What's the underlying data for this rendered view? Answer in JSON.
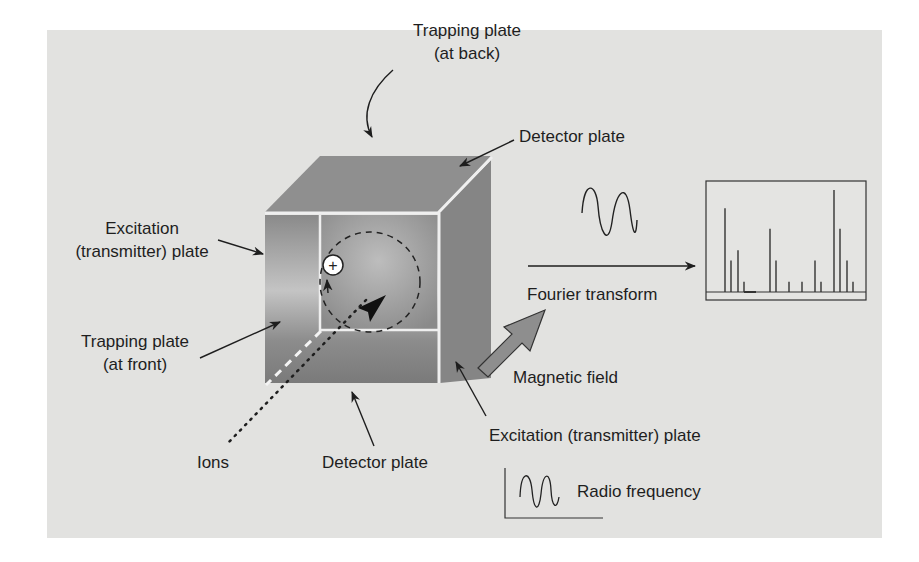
{
  "figure": {
    "panel_color": "#e2e2e0",
    "cube_colors": {
      "top": "#8f8f8f",
      "front_light": "#bdbdbd",
      "front_dark": "#7d7d7d",
      "side": "#858585",
      "edge": "#efefef"
    }
  },
  "labels": {
    "trapping_back_line1": "Trapping plate",
    "trapping_back_line2": "(at back)",
    "detector_top": "Detector plate",
    "excitation_left_line1": "Excitation",
    "excitation_left_line2": "(transmitter) plate",
    "trapping_front_line1": "Trapping plate",
    "trapping_front_line2": "(at front)",
    "ions": "Ions",
    "detector_bottom": "Detector plate",
    "fourier_transform": "Fourier transform",
    "magnetic_field": "Magnetic field",
    "excitation_right": "Excitation (transmitter) plate",
    "radio_frequency": "Radio frequency"
  },
  "ion_symbol": "+",
  "spectrum": {
    "description": "Mass spectrum output (line spectrum)",
    "peaks_relative_height": [
      0.82,
      0.31,
      0.41,
      0.1,
      0.62,
      0.31,
      0.1,
      0.1,
      0.31,
      0.1,
      1.0,
      0.62,
      0.31,
      0.1
    ]
  }
}
